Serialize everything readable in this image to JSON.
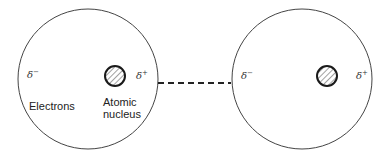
{
  "diagram": {
    "type": "atom-dipole-interaction",
    "atoms": [
      {
        "id": "left-atom",
        "delta_minus": "δ",
        "delta_minus_sign": "−",
        "delta_plus": "δ",
        "delta_plus_sign": "+",
        "labels": {
          "electrons": "Electrons",
          "nucleus_line1": "Atomic",
          "nucleus_line2": "nucleus"
        }
      },
      {
        "id": "right-atom",
        "delta_minus": "δ",
        "delta_minus_sign": "−",
        "delta_plus": "δ",
        "delta_plus_sign": "+"
      }
    ],
    "connector": "dashed",
    "colors": {
      "outline": "#333333",
      "nucleus_outline": "#1a1a1a",
      "hatch": "#444444",
      "background": "#ffffff"
    }
  }
}
